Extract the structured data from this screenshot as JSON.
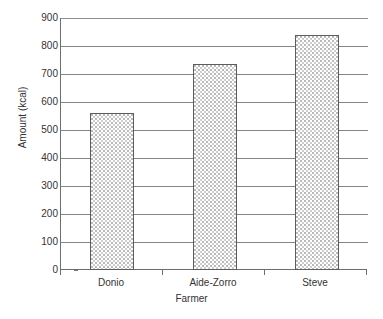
{
  "chart_data": {
    "type": "bar",
    "title": "",
    "subtitle": "",
    "categories": [
      "Donio",
      "Aide-Zorro",
      "Steve"
    ],
    "values": [
      560,
      735,
      840
    ],
    "xlabel": "Farmer",
    "ylabel": "Amount (kcal)",
    "ylim": [
      0,
      900
    ],
    "ytick_step": 100,
    "yticks": [
      900,
      800,
      700,
      600,
      500,
      400,
      300,
      200,
      100,
      0
    ],
    "ytick_labels": [
      "900",
      "800",
      "700",
      "600",
      "500",
      "400",
      "300",
      "200",
      "100",
      "0"
    ],
    "grid": "horizontal",
    "legend": "none",
    "bar_fill": "dotted-stipple",
    "colors": {
      "bar_fill": "#ffffff",
      "bar_pattern": "#c0c0c0",
      "bar_border": "#5c5c5c",
      "gridline": "#858585",
      "axis": "#6e6e6e",
      "text": "#333333",
      "background": "#ffffff"
    }
  }
}
